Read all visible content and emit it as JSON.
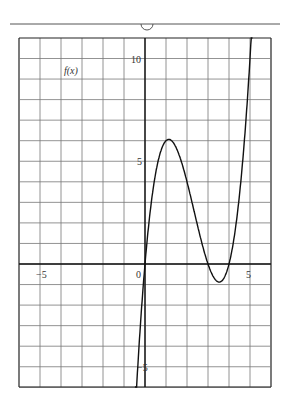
{
  "chart_data": {
    "type": "line",
    "title": "",
    "function_label": "f(x)",
    "xlabel": "",
    "ylabel": "f(x)",
    "xlim": [
      -6,
      6
    ],
    "ylim": [
      -6,
      11
    ],
    "grid": true,
    "grid_step": 1,
    "x_tick_labels": [
      {
        "value": -5,
        "label": "−5"
      },
      {
        "value": 0,
        "label": "0"
      },
      {
        "value": 5,
        "label": "5"
      }
    ],
    "y_tick_labels": [
      {
        "value": 10,
        "label": "10"
      },
      {
        "value": 5,
        "label": "5"
      },
      {
        "value": -5,
        "label": "−5"
      }
    ],
    "series": [
      {
        "name": "f(x)",
        "description": "cubic with roots near x=0, x=3, x=4",
        "x": [
          -0.45,
          -0.25,
          0,
          0.25,
          0.5,
          0.75,
          1.0,
          1.1,
          1.25,
          1.5,
          1.75,
          2.0,
          2.25,
          2.5,
          2.75,
          3.0,
          3.25,
          3.5,
          3.75,
          4.0,
          4.25,
          4.5,
          4.75,
          5.0,
          5.1
        ],
        "values": [
          -6.9,
          -3.6,
          0,
          1.98,
          3.5,
          4.6,
          5.3,
          6.1,
          6.0,
          5.6,
          4.4,
          4.0,
          3.2,
          2.5,
          1.0,
          0,
          -0.7,
          -0.875,
          -0.7,
          0,
          1.06,
          2.8,
          5.3,
          10.0,
          11.0
        ]
      }
    ],
    "key_points": {
      "local_max": {
        "x": 1.1,
        "y": 6.1
      },
      "local_min": {
        "x": 3.5,
        "y": -0.9
      },
      "roots": [
        0,
        3.0,
        4.0
      ]
    }
  },
  "page": {
    "top_rule": true,
    "top_marker": "semicircle"
  }
}
